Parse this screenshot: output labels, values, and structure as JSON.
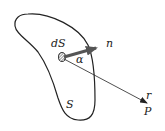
{
  "diagram": {
    "labels": {
      "surface_element": "dS",
      "normal": "n",
      "angle": "α",
      "surface": "S",
      "distance": "r",
      "point": "P"
    },
    "colors": {
      "stroke": "#222222",
      "normal_arrow": "#555555",
      "background": "#ffffff"
    }
  }
}
